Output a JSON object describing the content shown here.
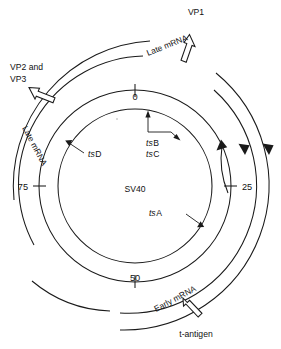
{
  "figure": {
    "name": "SV40 genome transcription map",
    "center_label": "SV40",
    "stroke_color": "#1a1a1a",
    "background_color": "#ffffff"
  },
  "map": {
    "ticks": [
      {
        "label": "0",
        "position_deg": 0,
        "anchor": "top"
      },
      {
        "label": "25",
        "position_deg": 90,
        "anchor": "right"
      },
      {
        "label": "50",
        "position_deg": 180,
        "anchor": "bottom"
      },
      {
        "label": "75",
        "position_deg": 270,
        "anchor": "left"
      }
    ],
    "mutants": [
      {
        "prefix": "ts",
        "gene": "A",
        "label": "tsA"
      },
      {
        "prefix": "ts",
        "gene": "B",
        "label": "tsB"
      },
      {
        "prefix": "ts",
        "gene": "C",
        "label": "tsC"
      },
      {
        "prefix": "ts",
        "gene": "D",
        "label": "tsD"
      }
    ]
  },
  "transcripts": {
    "late_vp1": {
      "mrna_label": "Late mRNA",
      "product": "VP1"
    },
    "late_vp23": {
      "mrna_label": "Late mRNA",
      "product_line1": "VP2 and",
      "product_line2": "VP3"
    },
    "early": {
      "mrna_label": "Early mRNA",
      "product": "t-antigen"
    }
  }
}
